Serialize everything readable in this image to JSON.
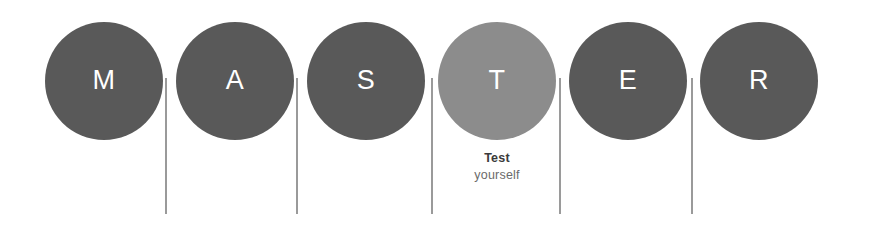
{
  "canvas": {
    "width": 871,
    "height": 233,
    "background_color": "#ffffff"
  },
  "palette": {
    "circle_dark": "#595959",
    "circle_light": "#8c8c8c",
    "letter_color": "#ffffff",
    "divider_color": "#9a9a9a",
    "caption_title_color": "#3b3b3b",
    "caption_sub_color": "#6b6b6b"
  },
  "word": "MASTER",
  "steps": [
    {
      "letter": "M",
      "color": "#595959",
      "highlighted": false,
      "left": 36,
      "caption_title": "",
      "caption_sub": ""
    },
    {
      "letter": "A",
      "color": "#595959",
      "highlighted": false,
      "left": 167,
      "caption_title": "",
      "caption_sub": ""
    },
    {
      "letter": "S",
      "color": "#595959",
      "highlighted": false,
      "left": 298,
      "caption_title": "",
      "caption_sub": ""
    },
    {
      "letter": "T",
      "color": "#8c8c8c",
      "highlighted": true,
      "left": 429,
      "caption_title": "Test",
      "caption_sub": "yourself"
    },
    {
      "letter": "E",
      "color": "#595959",
      "highlighted": false,
      "left": 560,
      "caption_title": "",
      "caption_sub": ""
    },
    {
      "letter": "R",
      "color": "#595959",
      "highlighted": false,
      "left": 691,
      "caption_title": "",
      "caption_sub": ""
    }
  ],
  "dividers": [
    {
      "left": 165
    },
    {
      "left": 296
    },
    {
      "left": 431
    },
    {
      "left": 559
    },
    {
      "left": 691
    }
  ]
}
